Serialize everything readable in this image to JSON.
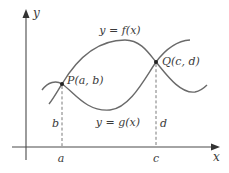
{
  "axes": {
    "x_label": "x",
    "y_label": "y"
  },
  "curves": [
    {
      "id": "f",
      "label": "y = f(x)",
      "color": "#6a6a6a"
    },
    {
      "id": "g",
      "label": "y = g(x)",
      "color": "#6a6a6a"
    }
  ],
  "points": [
    {
      "id": "P",
      "label": "P(a, b)",
      "x_tick": "a",
      "y_value": "b"
    },
    {
      "id": "Q",
      "label": "Q(c, d)",
      "x_tick": "c",
      "y_value": "d"
    }
  ],
  "colors": {
    "axis": "#4a4a4a",
    "curve": "#6a6a6a",
    "text": "#3a3a3a",
    "background": "#ffffff"
  }
}
